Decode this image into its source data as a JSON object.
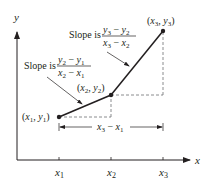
{
  "diagram": {
    "axes": {
      "x_label": "x",
      "y_label": "y",
      "ticks": [
        {
          "name": "x",
          "sub": "1"
        },
        {
          "name": "x",
          "sub": "2"
        },
        {
          "name": "x",
          "sub": "3"
        }
      ]
    },
    "points": [
      {
        "label": "(x1, y1)",
        "x": "x",
        "xs": "1",
        "y": "y",
        "ys": "1"
      },
      {
        "label": "(x2, y2)",
        "x": "x",
        "xs": "2",
        "y": "y",
        "ys": "2"
      },
      {
        "label": "(x3, y3)",
        "x": "x",
        "xs": "3",
        "y": "y",
        "ys": "3"
      }
    ],
    "slope_labels": [
      {
        "prefix": "Slope is",
        "numerator": "y2 − y1",
        "denominator": "x2 − x1"
      },
      {
        "prefix": "Slope is",
        "numerator": "y3 − y2",
        "denominator": "x3 − x2"
      }
    ],
    "dimension": {
      "label": "x3 − x1"
    },
    "colors": {
      "ink": "#231f20",
      "dash": "#6d6e71"
    }
  }
}
